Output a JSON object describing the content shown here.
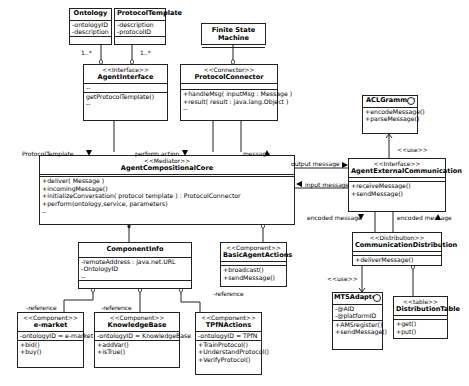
{
  "classes": {
    "ontology": {
      "name": "Ontology",
      "attributes": [
        "-ontologyID",
        "-description"
      ],
      "multiplicity": "1..*"
    },
    "protocol_template": {
      "name": "ProtocolTemplate",
      "attributes": [
        "-description",
        "-protocolID"
      ],
      "multiplicity": "1..*"
    },
    "fsm": {
      "name": "Finite State Machine"
    },
    "agent_interface": {
      "stereotype": "<<Interface>>",
      "name": "AgentInterface",
      "attributes": [
        "--"
      ],
      "operations": [
        "getProtocolTemplate()",
        "--"
      ]
    },
    "protocol_connector": {
      "stereotype": "<<Connector>>",
      "name": "ProtocolConnector",
      "operations": [
        "+handleMsg( inputMsg : Message )",
        "+result( result : java.lang.Object )",
        "--"
      ]
    },
    "acl_grammar": {
      "name": "ACLGrammar",
      "operations": [
        "+encodeMessage()",
        "+parseMessage()"
      ]
    },
    "core": {
      "stereotype": "<<Mediator>>",
      "name": "AgentCompositionalCore",
      "operations": [
        "+deliver( Message )",
        "+incomingMessage()",
        "+initializeConversation( protocol template ) : ProtocolConnector",
        "+perform(ontology,service, parameters)",
        "--"
      ]
    },
    "external_comm": {
      "stereotype": "<<Interface>>",
      "name": "AgentExternalCommunication",
      "operations": [
        "+receiveMessage()",
        "+sendMessage()"
      ]
    },
    "component_info": {
      "name": "ComponentInfo",
      "attributes": [
        "-remoteAddress : java.net.URL",
        "-OntologyID",
        "--"
      ]
    },
    "basic_actions": {
      "stereotype": "<<Component>>",
      "name": "BasicAgentActions",
      "operations": [
        "+broadcast()",
        "+sendMessage()"
      ]
    },
    "comm_distribution": {
      "stereotype": "<<Distribution>>",
      "name": "CommunicationDistribution",
      "operations": [
        "+deliverMessage()"
      ]
    },
    "emarket": {
      "stereotype": "<<Component>>",
      "name": "e-market",
      "attributes": [
        "-ontologyID = e-market"
      ],
      "operations": [
        "+bid()",
        "+buy()"
      ]
    },
    "knowledge_base": {
      "stereotype": "<<Component>>",
      "name": "KnowledgeBase",
      "attributes": [
        "-ontologyID = KnowledgeBase"
      ],
      "operations": [
        "+addVar()",
        "+isTrue()"
      ]
    },
    "tpfn_actions": {
      "stereotype": "<<Component>>",
      "name": "TPfNActions",
      "attributes": [
        "-ontologyID = TPfN"
      ],
      "operations": [
        "+TrainProtocol()",
        "+UnderstandProtocol()",
        "+VerifyProtocol()"
      ]
    },
    "mts_adapter": {
      "name": "MTSAdapter",
      "attributes": [
        "-@AID",
        "-@platformID"
      ],
      "operations": [
        "+AMSregister()",
        "+sendMessage()"
      ]
    },
    "distribution_table": {
      "stereotype": "<<table>>",
      "name": "DistributionTable",
      "operations": [
        "+get()",
        "+put()"
      ]
    }
  },
  "labels": {
    "protocol_template": "ProtocolTemplate",
    "perform_action": "perform action",
    "message": "message",
    "output_message": "output message",
    "input_message": "input message",
    "use1": "<<use>>",
    "use2": "<<use>>",
    "encoded_message_down": "encoded message",
    "encoded_message_up": "encoded message",
    "ref1": "-reference",
    "ref2": "-reference",
    "ref3": "-reference"
  }
}
